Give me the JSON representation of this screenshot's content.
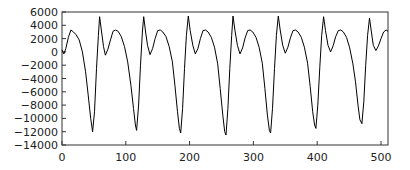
{
  "chart_data": {
    "type": "line",
    "title": "",
    "xlabel": "",
    "ylabel": "",
    "xlim": [
      0,
      512
    ],
    "ylim": [
      -14000,
      6000
    ],
    "grid": false,
    "legend": null,
    "xticks": [
      0,
      100,
      200,
      300,
      400,
      500
    ],
    "yticks": [
      6000,
      4000,
      2000,
      0,
      -2000,
      -4000,
      -6000,
      -8000,
      -10000,
      -12000,
      -14000
    ],
    "series": [
      {
        "name": "signal",
        "color": "#000000",
        "points": [
          [
            0,
            300
          ],
          [
            3,
            -300
          ],
          [
            6,
            500
          ],
          [
            10,
            2200
          ],
          [
            14,
            3300
          ],
          [
            18,
            3000
          ],
          [
            22,
            2600
          ],
          [
            27,
            1800
          ],
          [
            32,
            0
          ],
          [
            37,
            -3000
          ],
          [
            41,
            -6500
          ],
          [
            45,
            -10000
          ],
          [
            48,
            -12000
          ],
          [
            51,
            -9000
          ],
          [
            54,
            -2500
          ],
          [
            57,
            2500
          ],
          [
            59,
            5300
          ],
          [
            62,
            3000
          ],
          [
            65,
            800
          ],
          [
            68,
            -500
          ],
          [
            72,
            400
          ],
          [
            76,
            1800
          ],
          [
            80,
            3100
          ],
          [
            84,
            3300
          ],
          [
            88,
            3100
          ],
          [
            93,
            2300
          ],
          [
            98,
            800
          ],
          [
            103,
            -1500
          ],
          [
            108,
            -5000
          ],
          [
            112,
            -8500
          ],
          [
            115,
            -11000
          ],
          [
            117,
            -11800
          ],
          [
            120,
            -8000
          ],
          [
            123,
            -2000
          ],
          [
            126,
            3000
          ],
          [
            128,
            5300
          ],
          [
            131,
            3000
          ],
          [
            134,
            1000
          ],
          [
            138,
            -400
          ],
          [
            142,
            500
          ],
          [
            146,
            2000
          ],
          [
            150,
            3200
          ],
          [
            154,
            3300
          ],
          [
            158,
            3000
          ],
          [
            163,
            2300
          ],
          [
            168,
            800
          ],
          [
            173,
            -1500
          ],
          [
            177,
            -5000
          ],
          [
            181,
            -9000
          ],
          [
            184,
            -11500
          ],
          [
            186,
            -12200
          ],
          [
            189,
            -8500
          ],
          [
            192,
            -2500
          ],
          [
            195,
            2500
          ],
          [
            198,
            5400
          ],
          [
            201,
            3200
          ],
          [
            205,
            1000
          ],
          [
            209,
            -300
          ],
          [
            213,
            500
          ],
          [
            217,
            2000
          ],
          [
            221,
            3200
          ],
          [
            225,
            3300
          ],
          [
            229,
            3000
          ],
          [
            234,
            2200
          ],
          [
            239,
            700
          ],
          [
            244,
            -1800
          ],
          [
            248,
            -5500
          ],
          [
            252,
            -9500
          ],
          [
            255,
            -12000
          ],
          [
            257,
            -12500
          ],
          [
            260,
            -8500
          ],
          [
            263,
            -2500
          ],
          [
            266,
            2500
          ],
          [
            268,
            5400
          ],
          [
            271,
            3300
          ],
          [
            275,
            1000
          ],
          [
            279,
            -300
          ],
          [
            283,
            600
          ],
          [
            287,
            2100
          ],
          [
            291,
            3200
          ],
          [
            295,
            3300
          ],
          [
            299,
            3000
          ],
          [
            304,
            2200
          ],
          [
            309,
            700
          ],
          [
            314,
            -1700
          ],
          [
            318,
            -5500
          ],
          [
            322,
            -9500
          ],
          [
            325,
            -11800
          ],
          [
            327,
            -12200
          ],
          [
            330,
            -8500
          ],
          [
            333,
            -2500
          ],
          [
            336,
            2500
          ],
          [
            339,
            5400
          ],
          [
            342,
            3300
          ],
          [
            346,
            1000
          ],
          [
            350,
            -200
          ],
          [
            354,
            700
          ],
          [
            358,
            2100
          ],
          [
            362,
            3200
          ],
          [
            366,
            3300
          ],
          [
            370,
            3000
          ],
          [
            375,
            2200
          ],
          [
            380,
            700
          ],
          [
            385,
            -1700
          ],
          [
            389,
            -5200
          ],
          [
            393,
            -9000
          ],
          [
            396,
            -11000
          ],
          [
            398,
            -11500
          ],
          [
            401,
            -8000
          ],
          [
            404,
            -2300
          ],
          [
            407,
            2500
          ],
          [
            410,
            5300
          ],
          [
            413,
            3200
          ],
          [
            417,
            1000
          ],
          [
            421,
            0
          ],
          [
            425,
            900
          ],
          [
            429,
            2300
          ],
          [
            433,
            3200
          ],
          [
            437,
            3300
          ],
          [
            441,
            3000
          ],
          [
            446,
            2200
          ],
          [
            451,
            600
          ],
          [
            456,
            -1800
          ],
          [
            460,
            -4500
          ],
          [
            464,
            -8000
          ],
          [
            467,
            -10200
          ],
          [
            470,
            -10800
          ],
          [
            473,
            -7500
          ],
          [
            476,
            -2000
          ],
          [
            479,
            2500
          ],
          [
            482,
            5100
          ],
          [
            485,
            3000
          ],
          [
            488,
            1000
          ],
          [
            492,
            200
          ],
          [
            496,
            900
          ],
          [
            500,
            2000
          ],
          [
            504,
            3000
          ],
          [
            508,
            3300
          ],
          [
            511,
            3100
          ]
        ]
      }
    ]
  }
}
